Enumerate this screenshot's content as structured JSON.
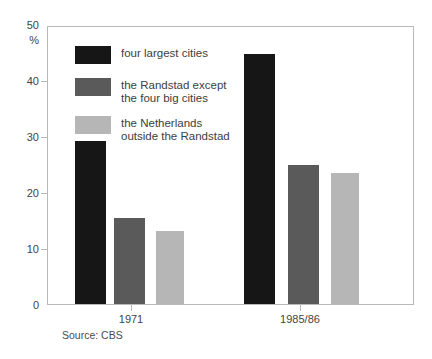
{
  "chart_data": {
    "type": "bar",
    "title": "",
    "subtitle": "",
    "xlabel": "",
    "ylabel": "%",
    "categories": [
      "1971",
      "1985/86"
    ],
    "series": [
      {
        "name": "four largest cities",
        "color": "#161616",
        "values": [
          29.3,
          44.8
        ]
      },
      {
        "name": "the Randstad except\nthe four big cities",
        "color": "#5a5a5a",
        "values": [
          15.4,
          24.9
        ]
      },
      {
        "name": "the Netherlands\noutside the Randstad",
        "color": "#b6b6b6",
        "values": [
          13.1,
          23.5
        ]
      }
    ],
    "ylim": [
      0,
      50
    ],
    "yticks": [
      0,
      10,
      20,
      30,
      40,
      50
    ],
    "ytick_labels": [
      "0",
      "10",
      "20",
      "30",
      "40",
      "50"
    ],
    "grid": false,
    "legend_position": "upper-left-inside",
    "axis_unit": "%"
  },
  "legend": {
    "entries": [
      {
        "label": "four largest cities"
      },
      {
        "label": "the Randstad except\nthe four big cities"
      },
      {
        "label": "the Netherlands\noutside the Randstad"
      }
    ]
  },
  "footer": {
    "source": "Source: CBS"
  }
}
